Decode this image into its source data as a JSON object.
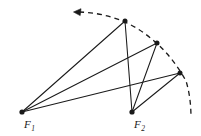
{
  "figure": {
    "type": "geometry-diagram",
    "background_color": "#ffffff",
    "stroke_color": "#1a1a1a",
    "points": [
      {
        "id": "F1",
        "label": "F",
        "subscript": "1",
        "x": 22,
        "y": 112,
        "label_x": 24,
        "label_y": 127,
        "dot_radius": 2.4
      },
      {
        "id": "F2",
        "label": "F",
        "subscript": "2",
        "x": 132,
        "y": 112,
        "label_x": 134,
        "label_y": 127,
        "dot_radius": 2.4
      },
      {
        "id": "P1",
        "label": "",
        "subscript": "",
        "x": 125,
        "y": 21,
        "dot_radius": 2.4
      },
      {
        "id": "P2",
        "label": "",
        "subscript": "",
        "x": 157,
        "y": 43,
        "dot_radius": 2.4
      },
      {
        "id": "P3",
        "label": "",
        "subscript": "",
        "x": 180,
        "y": 73,
        "dot_radius": 2.4
      }
    ],
    "segments": [
      {
        "from": "F1",
        "to": "P1"
      },
      {
        "from": "F1",
        "to": "P2"
      },
      {
        "from": "F1",
        "to": "P3"
      },
      {
        "from": "F2",
        "to": "P1"
      },
      {
        "from": "F2",
        "to": "P2"
      },
      {
        "from": "F2",
        "to": "P3"
      }
    ],
    "arc": {
      "style": "dashed",
      "dash_pattern": "5,4",
      "stroke_width": 1.3,
      "path": "M 79 12 Q 112 13 138 29 Q 168 48 186 81 Q 191 97 191 118",
      "arrow": {
        "direction": "left",
        "tip_x": 74,
        "tip_y": 12,
        "size": 6
      }
    }
  }
}
